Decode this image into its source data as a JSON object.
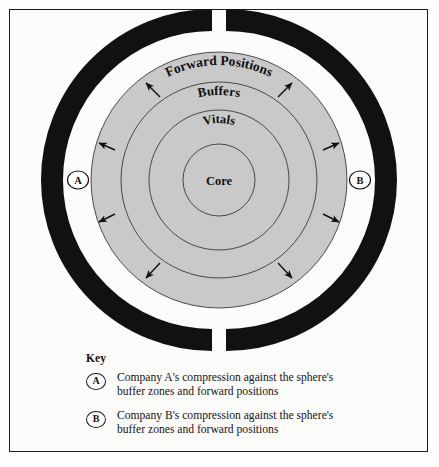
{
  "diagram": {
    "type": "concentric-ring-model",
    "background_color": "#fcfcfb",
    "frame_color": "#1b1b1b",
    "sphere_fill": "#c9c9c9",
    "arc_color": "#111111",
    "rings": [
      {
        "name": "forward-positions",
        "label": "Forward Positions",
        "outer_radius": 128,
        "curved": true
      },
      {
        "name": "buffers",
        "label": "Buffers",
        "outer_radius": 98,
        "curved": true
      },
      {
        "name": "vitals",
        "label": "Vitals",
        "outer_radius": 70,
        "curved": true
      },
      {
        "name": "core",
        "label": "Core",
        "outer_radius": 36,
        "curved": false
      }
    ],
    "center": {
      "x": 219,
      "y": 180
    },
    "arcs": [
      {
        "name": "compression-arc-left",
        "badge": "A",
        "badge_x": 78,
        "badge_y": 180
      },
      {
        "name": "compression-arc-right",
        "badge": "B",
        "badge_x": 360,
        "badge_y": 180
      }
    ],
    "arrow_count": 8,
    "arrow_direction": "radially-outward"
  },
  "key": {
    "title": "Key",
    "entries": [
      {
        "badge": "A",
        "line1": "Company A's compression against the sphere's",
        "line2": "buffer zones and forward positions"
      },
      {
        "badge": "B",
        "line1": "Company B's compression against the sphere's",
        "line2": "buffer zones and forward positions"
      }
    ]
  }
}
